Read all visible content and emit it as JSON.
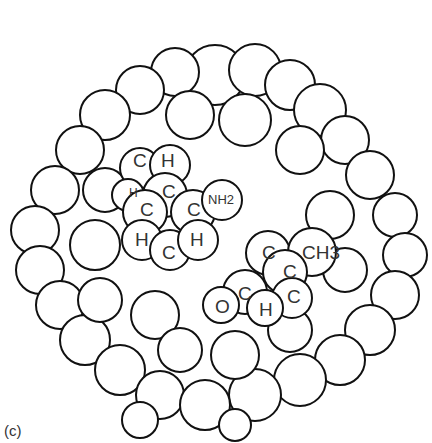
{
  "figure": {
    "panel_label": "(c)",
    "ring1": {
      "atoms": [
        {
          "label": "C",
          "x": 139,
          "y": 160
        },
        {
          "label": "H",
          "x": 168,
          "y": 160
        },
        {
          "label": "H",
          "x": 132,
          "y": 193
        },
        {
          "label": "C",
          "x": 168,
          "y": 190
        },
        {
          "label": "C",
          "x": 146,
          "y": 208
        },
        {
          "label": "C",
          "x": 193,
          "y": 208
        },
        {
          "label": "NH2",
          "x": 212,
          "y": 194
        },
        {
          "label": "H",
          "x": 141,
          "y": 236
        },
        {
          "label": "C",
          "x": 167,
          "y": 250
        },
        {
          "label": "H",
          "x": 196,
          "y": 236
        }
      ]
    },
    "ring2": {
      "atoms": [
        {
          "label": "C",
          "x": 264,
          "y": 249
        },
        {
          "label": "CH3",
          "x": 303,
          "y": 249
        },
        {
          "label": "C",
          "x": 285,
          "y": 268
        },
        {
          "label": "C",
          "x": 240,
          "y": 290
        },
        {
          "label": "C",
          "x": 292,
          "y": 295
        },
        {
          "label": "O",
          "x": 221,
          "y": 306
        },
        {
          "label": "H",
          "x": 264,
          "y": 307
        }
      ]
    },
    "stroke_color": "#111111",
    "fill_color": "#ffffff"
  }
}
